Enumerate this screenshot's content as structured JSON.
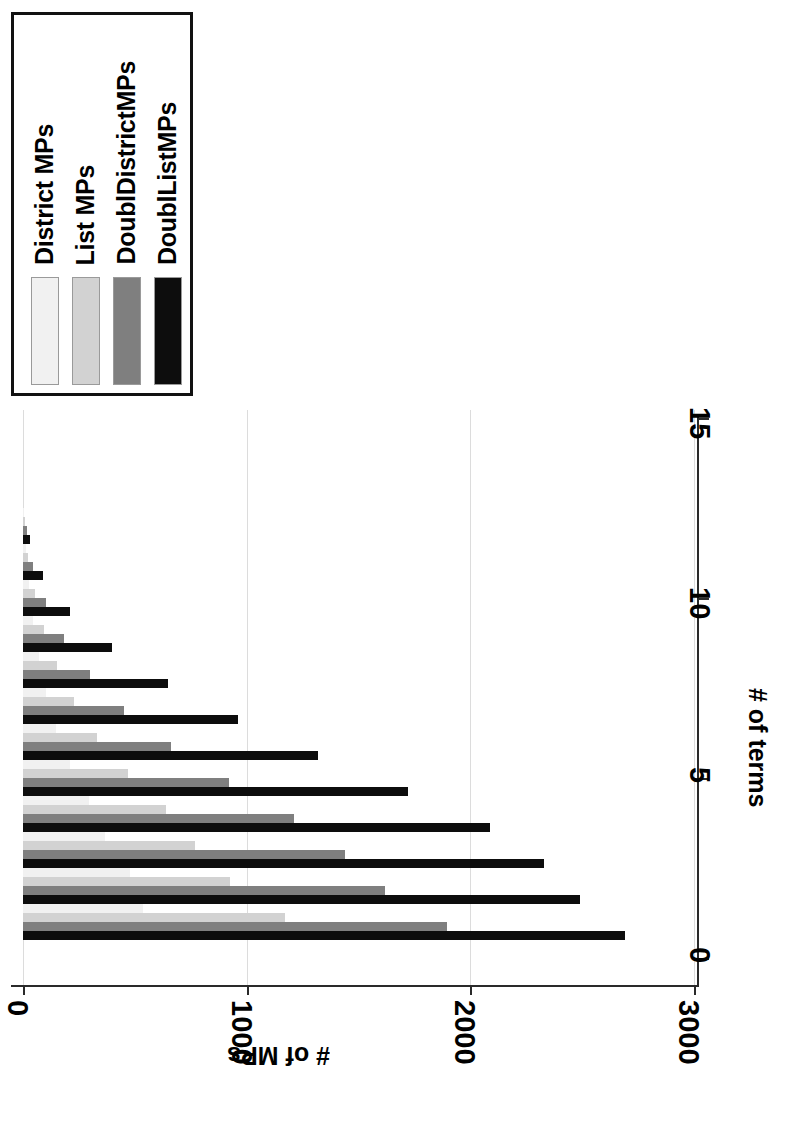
{
  "chart_data": {
    "type": "bar",
    "orientation": "vertical-rotated",
    "title": "",
    "xlabel": "# of terms",
    "ylabel": "# of MPs",
    "xticks": [
      "0",
      "5",
      "10",
      "15"
    ],
    "xtick_values": [
      0,
      5,
      10,
      15
    ],
    "yticks": [
      "0",
      "1000",
      "2000",
      "3000"
    ],
    "ytick_values": [
      0,
      1000,
      2000,
      3000
    ],
    "ylim": [
      0,
      3000
    ],
    "xlim": [
      0,
      15
    ],
    "grid": true,
    "legend_position": "top-left",
    "categories": [
      1,
      2,
      3,
      4,
      5,
      6,
      7,
      8,
      9,
      10,
      11,
      12
    ],
    "series": [
      {
        "name": "District MPs",
        "color": "#f1f1f1",
        "values": [
          536,
          478,
          366,
          295,
          210,
          148,
          104,
          72,
          45,
          28,
          12,
          5
        ]
      },
      {
        "name": "List MPs",
        "color": "#d2d2d2",
        "values": [
          1171,
          925,
          770,
          640,
          470,
          330,
          228,
          150,
          96,
          55,
          24,
          9
        ]
      },
      {
        "name": "DoublDistrictMPs",
        "color": "#7f7f7f",
        "values": [
          1895,
          1620,
          1440,
          1210,
          920,
          660,
          452,
          300,
          182,
          102,
          46,
          16
        ]
      },
      {
        "name": "DoublListMPs",
        "color": "#0d0d0d",
        "values": [
          2690,
          2490,
          2330,
          2090,
          1720,
          1320,
          960,
          650,
          400,
          210,
          88,
          30
        ]
      }
    ]
  },
  "legend": {
    "entries": [
      {
        "label": "District MPs",
        "color": "#f1f1f1"
      },
      {
        "label": "List MPs",
        "color": "#d2d2d2"
      },
      {
        "label": "DoublDistrictMPs",
        "color": "#7f7f7f"
      },
      {
        "label": "DoublListMPs",
        "color": "#0d0d0d"
      }
    ]
  },
  "axes": {
    "value_axis_title": "# of MPs",
    "category_axis_title": "# of terms",
    "value_ticks": [
      "0",
      "1000",
      "2000",
      "3000"
    ],
    "category_ticks": [
      "0",
      "5",
      "10",
      "15"
    ]
  }
}
